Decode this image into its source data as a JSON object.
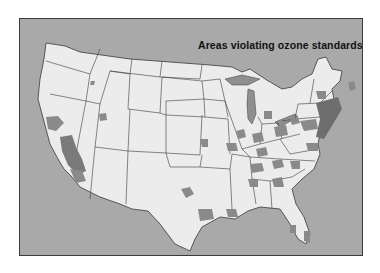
{
  "map": {
    "title": "Areas violating ozone standards",
    "region": "Contiguous United States",
    "colors": {
      "background": "#a9a9a9",
      "land": "#ececec",
      "borders": "#3a3a3a",
      "violation_areas": "#8a8a8a",
      "severe_areas": "#6e6e6e"
    },
    "legend": {
      "shaded_label": "Areas violating ozone standards"
    }
  }
}
